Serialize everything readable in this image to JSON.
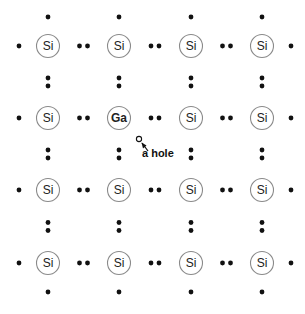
{
  "diagram": {
    "grid": {
      "cols_x": [
        48,
        119,
        191,
        262
      ],
      "rows_y": [
        46,
        118,
        190,
        263
      ],
      "atom_radius": 11.5
    },
    "atoms": [
      [
        "Si",
        "Si",
        "Si",
        "Si"
      ],
      [
        "Si",
        "Ga",
        "Si",
        "Si"
      ],
      [
        "Si",
        "Si",
        "Si",
        "Si"
      ],
      [
        "Si",
        "Si",
        "Si",
        "Si"
      ]
    ],
    "dopant": {
      "symbol": "Ga",
      "row": 1,
      "col": 1
    },
    "missing_bond": {
      "between": [
        [
          1,
          1
        ],
        [
          2,
          1
        ]
      ],
      "note": "Ga has only 3 valence electrons"
    },
    "hole": {
      "label": "a hole",
      "marker_x": 139,
      "marker_y": 139,
      "label_x": 142,
      "label_y": 157
    },
    "colors": {
      "electron": "#111111",
      "atom_outline": "#8a8a8a",
      "background": "#ffffff"
    }
  }
}
